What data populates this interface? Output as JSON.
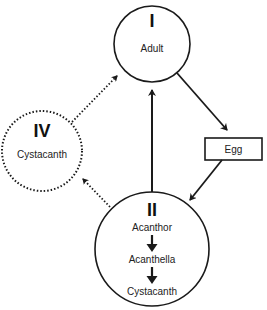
{
  "diagram": {
    "nodes": {
      "adult": {
        "numeral": "I",
        "label": "Adult"
      },
      "egg": {
        "label": "Egg"
      },
      "larval": {
        "numeral": "II",
        "stages": [
          "Acanthor",
          "Acanthella",
          "Cystacanth"
        ]
      },
      "paratenic": {
        "numeral": "IV",
        "label": "Cystacanth"
      }
    },
    "edges": [
      {
        "from": "adult",
        "to": "egg",
        "style": "solid"
      },
      {
        "from": "egg",
        "to": "larval",
        "style": "solid"
      },
      {
        "from": "larval",
        "to": "adult",
        "style": "solid"
      },
      {
        "from": "larval",
        "to": "paratenic",
        "style": "dotted"
      },
      {
        "from": "paratenic",
        "to": "adult",
        "style": "dotted"
      }
    ],
    "colors": {
      "stroke": "#1a1a1a",
      "text": "#222222"
    }
  }
}
